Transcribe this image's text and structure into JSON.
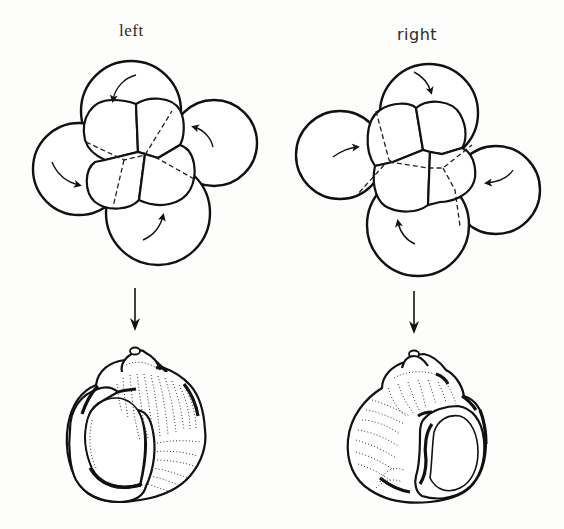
{
  "figure": {
    "panels": [
      {
        "id": "left",
        "label": "left",
        "embryo": {
          "description": "8-cell embryo with sinistral (counterclockwise) spiral cleavage",
          "macromeres": 4,
          "micromeres": 4,
          "rotation_arrows": "counterclockwise"
        },
        "arrow": "down-arrow",
        "shell": {
          "description": "sinistral (left-coiling) snail shell, aperture on left"
        }
      },
      {
        "id": "right",
        "label": "right",
        "embryo": {
          "description": "8-cell embryo with dextral (clockwise) spiral cleavage",
          "macromeres": 4,
          "micromeres": 4,
          "rotation_arrows": "clockwise"
        },
        "arrow": "down-arrow",
        "shell": {
          "description": "dextral (right-coiling) snail shell, aperture on right"
        }
      }
    ],
    "colors": {
      "background": "#fdfdfc",
      "ink": "#111111"
    }
  }
}
